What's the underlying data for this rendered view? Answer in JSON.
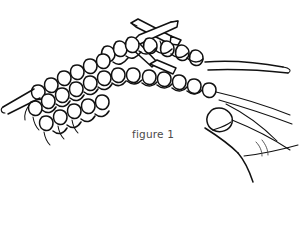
{
  "figure": {
    "caption": "figure 1",
    "style": "black-and-white line art",
    "background_color": "#ffffff",
    "ink_color": "#111111",
    "caption_color": "#4a4a4a",
    "canvas": {
      "width": 302,
      "height": 232
    },
    "elements": {
      "knitted_fabric_label": "knitted fabric in stockinette stitch",
      "needle_left_label": "knitting needle left",
      "needle_right_label": "knitting needle right",
      "needle_crossing_label": "crossed needle tips",
      "hand_label": "hand holding the knitting",
      "fingertip_label": "fingertip",
      "yarn_strand_label": "working yarn strand"
    }
  }
}
